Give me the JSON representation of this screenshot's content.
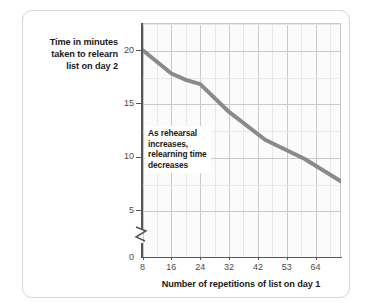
{
  "chart_data": {
    "type": "line",
    "title": "",
    "xlabel": "Number of repetitions of list on day 1",
    "ylabel": "Time in minutes taken to relearn list on day 2",
    "x_tick_labels": [
      "8",
      "16",
      "24",
      "32",
      "42",
      "53",
      "64"
    ],
    "y_tick_labels": [
      "0",
      "5",
      "10",
      "15",
      "20"
    ],
    "xlim": [
      8,
      64
    ],
    "ylim": [
      0,
      22
    ],
    "y_axis_break": true,
    "y_axis_break_between": [
      0,
      5
    ],
    "grid": true,
    "legend": false,
    "series": [
      {
        "name": "Relearning time",
        "color": "#8a8a8a",
        "x": [
          8,
          16,
          20,
          24,
          32,
          42,
          53,
          64
        ],
        "values": [
          20.0,
          17.8,
          17.2,
          16.8,
          14.2,
          11.6,
          9.8,
          7.5
        ]
      }
    ],
    "annotations": [
      {
        "text": "As rehearsal increases, relearning time decreases",
        "line1": "As rehearsal",
        "line2": "increases,",
        "line3": "relearning time",
        "line4": "decreases"
      }
    ]
  },
  "axis_titles": {
    "y_line1": "Time in minutes",
    "y_line2": "taken to relearn",
    "y_line3": "list on day 2",
    "x": "Number of repetitions of list on day 1"
  },
  "colors": {
    "line": "#8a8a8a",
    "axis": "#55565a",
    "gridline_major": "#c9c9c9",
    "gridline_minor": "#e8e8e8",
    "plot_background": "#fbfbfb",
    "card_border": "#d5d5d5",
    "text": "#1b1b1b"
  }
}
